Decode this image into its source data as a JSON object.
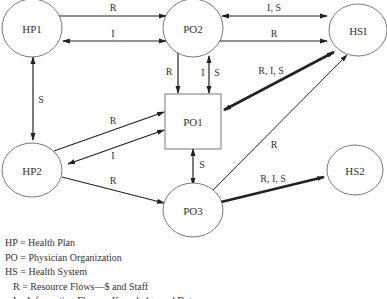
{
  "nodes": {
    "hp1": "HP1",
    "po2": "PO2",
    "hs1": "HSI",
    "po1": "PO1",
    "hp2": "HP2",
    "po3": "PO3",
    "hs2": "HS2"
  },
  "edges": {
    "hp1_po2_top": "R",
    "hp1_po2_bottom": "I",
    "po2_hs1_top": "I, S",
    "po2_hs1_bottom": "R",
    "po2_po1_left": "R",
    "po2_po1_right_i": "I",
    "po2_po1_right_s": "S",
    "hs1_po1": "R, I, S",
    "hp1_hp2": "S",
    "hp2_po1_top": "R",
    "hp2_po1_bottom": "I",
    "po1_po3": "S",
    "po3_hs1": "R",
    "hp2_po3": "R",
    "po3_hs2": "R, I, S"
  },
  "legend": [
    "HP = Health Plan",
    "PO = Physician Organization",
    "HS = Health System",
    "  R = Resource Flows—$ and Staff",
    "  I = Information Flows—Knowledge and Data"
  ]
}
